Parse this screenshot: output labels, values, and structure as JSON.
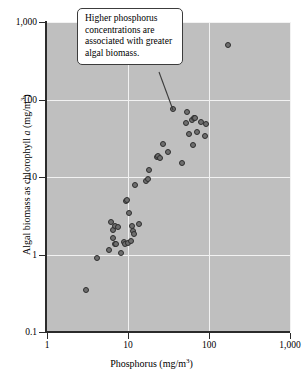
{
  "figure": {
    "background_color": "#ffffff",
    "plot_background_color": "#bfbfbf",
    "gridline_color": "#f2f2f2",
    "axis_color": "#2b2b2b",
    "point_fill_color": "#6e6e6e",
    "point_edge_color": "#2e2e2e"
  },
  "annotation": {
    "text": "Higher phosphorus concentrations are associated with greater algal biomass.",
    "line1": "Higher phosphorus",
    "line2": "concentrations are",
    "line3": "associated with greater",
    "line4": "algal biomass."
  },
  "axes": {
    "x_title_main": "Phosphorus (mg/m",
    "x_title_sup": "3",
    "x_title_close": ")",
    "y_title_pre": "Algal biomass as chlorophyll ",
    "y_title_italic": "a",
    "y_title_mid": " (mg/m",
    "y_title_sup": "3",
    "y_title_close": ")",
    "x_ticks": [
      "1",
      "10",
      "100",
      "1,000"
    ],
    "y_ticks": [
      "0.1",
      "1",
      "10",
      "100",
      "1,000"
    ]
  },
  "chart_data": {
    "type": "scatter",
    "title": "",
    "xlabel": "Phosphorus (mg/m3)",
    "ylabel": "Algal biomass as chlorophyll a (mg/m3)",
    "xscale": "log",
    "yscale": "log",
    "xlim": [
      1,
      1000
    ],
    "ylim": [
      0.1,
      1000
    ],
    "xticks": [
      1,
      10,
      100,
      1000
    ],
    "yticks": [
      0.1,
      1,
      10,
      100,
      1000
    ],
    "xticklabels": [
      "1",
      "10",
      "100",
      "1,000"
    ],
    "yticklabels": [
      "0.1",
      "1",
      "10",
      "100",
      "1,000"
    ],
    "grid": true,
    "legend": "none",
    "annotations": [
      {
        "text": "Higher phosphorus concentrations are associated with greater algal biomass.",
        "points_to_x": 36,
        "points_to_y": 75
      }
    ],
    "series": [
      {
        "name": "Lakes",
        "marker": "circle",
        "points": [
          [
            3.0,
            0.35
          ],
          [
            4.1,
            0.9
          ],
          [
            5.8,
            1.15
          ],
          [
            6.2,
            2.6
          ],
          [
            6.5,
            1.65
          ],
          [
            6.6,
            2.1
          ],
          [
            6.9,
            1.35
          ],
          [
            7.0,
            2.35
          ],
          [
            7.2,
            1.35
          ],
          [
            7.6,
            2.25
          ],
          [
            8.3,
            1.05
          ],
          [
            9.0,
            1.45
          ],
          [
            9.3,
            1.35
          ],
          [
            9.5,
            4.9
          ],
          [
            9.7,
            5.1
          ],
          [
            10.0,
            1.4
          ],
          [
            10.3,
            3.4
          ],
          [
            10.8,
            1.5
          ],
          [
            11.2,
            2.35
          ],
          [
            11.5,
            2.0
          ],
          [
            11.8,
            1.85
          ],
          [
            12.3,
            7.9
          ],
          [
            13.5,
            2.5
          ],
          [
            16.5,
            8.8
          ],
          [
            17.5,
            9.4
          ],
          [
            18.0,
            12.2
          ],
          [
            22.5,
            18.0
          ],
          [
            23.5,
            18.5
          ],
          [
            25.0,
            17.6
          ],
          [
            27.0,
            27.0
          ],
          [
            31.0,
            21.0
          ],
          [
            36.0,
            75.0
          ],
          [
            46.0,
            15.0
          ],
          [
            52.0,
            50.0
          ],
          [
            54.0,
            68.0
          ],
          [
            56.0,
            36.0
          ],
          [
            62.0,
            55.0
          ],
          [
            64.0,
            26.0
          ],
          [
            66.0,
            58.0
          ],
          [
            68.0,
            57.0
          ],
          [
            72.0,
            38.0
          ],
          [
            80.0,
            52.0
          ],
          [
            88.0,
            34.0
          ],
          [
            92.0,
            49.0
          ],
          [
            170.0,
            500.0
          ]
        ]
      }
    ]
  }
}
